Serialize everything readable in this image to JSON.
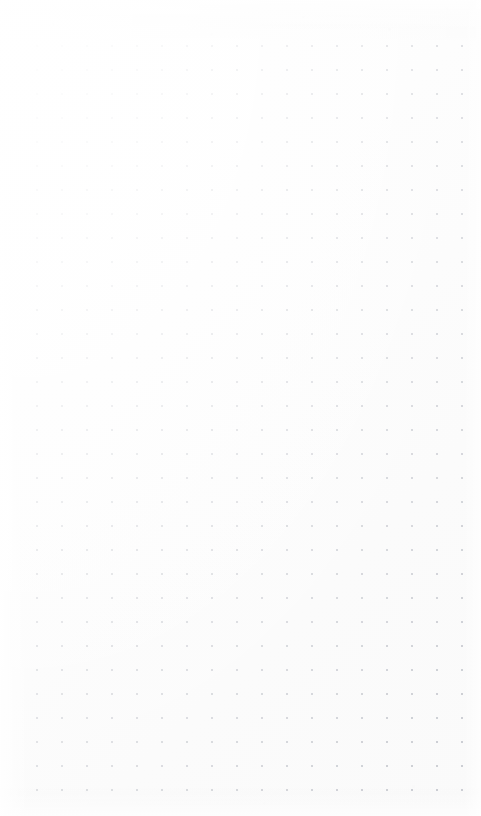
{
  "page": {
    "kind": "dot-grid-paper",
    "width": 481,
    "height": 816,
    "background_color": "#fefefe",
    "has_text_content": false,
    "content_note": ""
  },
  "grid": {
    "dot_color": "#b9bcc4",
    "dot_diameter_px": 2,
    "spacing_x_px": 25,
    "spacing_y_px": 24,
    "origin_x_px": 37,
    "origin_y_px": 46,
    "columns": 18,
    "rows": 32,
    "margin_left_px": 37,
    "margin_right_px": 19,
    "margin_top_px": 46,
    "margin_bottom_px": 26
  },
  "appearance": {
    "paper_tone": "#fdfdfd",
    "shading": "brighter toward upper-left, dots read darker toward lower-right",
    "texture": "faint paper fiber noise, strongest in the top margin",
    "vignette": "soft white falloff at all four edges"
  }
}
